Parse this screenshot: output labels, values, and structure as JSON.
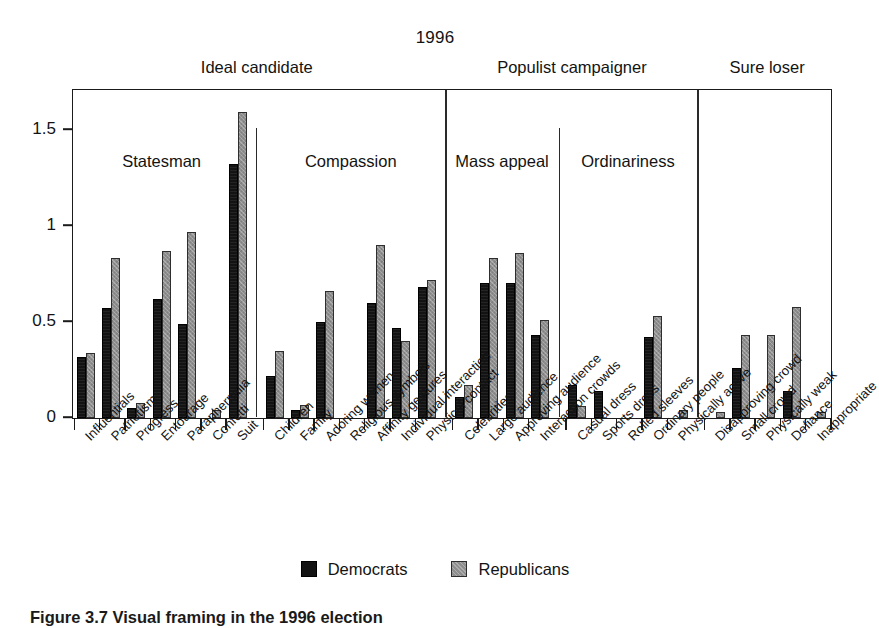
{
  "figure": {
    "year_title": "1996",
    "caption": "Figure 3.7 Visual framing in the 1996 election"
  },
  "legend": {
    "items": [
      {
        "label": "Democrats",
        "color": "#131313"
      },
      {
        "label": "Republicans",
        "color": "#8e8e8e"
      }
    ]
  },
  "supergroups": [
    {
      "label": "Ideal candidate"
    },
    {
      "label": "Populist campaigner"
    },
    {
      "label": "Sure loser"
    }
  ],
  "groups": [
    {
      "label": "Statesman"
    },
    {
      "label": "Compassion"
    },
    {
      "label": "Mass appeal"
    },
    {
      "label": "Ordinariness"
    },
    {
      "label": ""
    }
  ],
  "chart_data": {
    "type": "bar",
    "title": "1996",
    "xlabel": "",
    "ylabel": "",
    "ylim": [
      0,
      1.7
    ],
    "yticks": [
      0,
      0.5,
      1,
      1.5
    ],
    "ytick_labels": [
      "0",
      "0.5",
      "1",
      "1.5"
    ],
    "grid": false,
    "legend_position": "bottom-center",
    "series": [
      {
        "name": "Democrats",
        "color": "#131313",
        "values": [
          0.32,
          0.57,
          0.05,
          0.62,
          0.49,
          0.0,
          1.32,
          0.22,
          0.04,
          0.5,
          0.0,
          0.6,
          0.47,
          0.68,
          0.11,
          0.7,
          0.7,
          0.43,
          0.17,
          0.14,
          0.0,
          0.42,
          0.0,
          0.0,
          0.26,
          0.0,
          0.14,
          0.0
        ]
      },
      {
        "name": "Republicans",
        "color": "#8e8e8e",
        "values": [
          0.34,
          0.83,
          0.08,
          0.87,
          0.97,
          0.04,
          1.59,
          0.35,
          0.07,
          0.66,
          0.0,
          0.9,
          0.4,
          0.72,
          0.17,
          0.83,
          0.86,
          0.51,
          0.06,
          0.0,
          0.0,
          0.53,
          0.04,
          0.03,
          0.43,
          0.43,
          0.58,
          0.03
        ]
      }
    ],
    "categories": [
      "Influentials",
      "Patriotism",
      "Progress",
      "Entourage",
      "Paraphernalia",
      "Confetti",
      "Suit",
      "Children",
      "Family",
      "Adoring women",
      "Religious symbols",
      "Affinity gestures",
      "Individual interaction",
      "Physical contact",
      "Celebrities",
      "Large audience",
      "Approving audience",
      "Interaction crowds",
      "Casual dress",
      "Sports dress",
      "Rolled sleeves",
      "Ordinary people",
      "Physically active",
      "Disapproving crowd",
      "Small crowd",
      "Physically weak",
      "Defiance",
      "Inappropriate"
    ],
    "group_spans": [
      {
        "name": "Statesman",
        "start": 0,
        "end": 6,
        "supergroup": "Ideal candidate"
      },
      {
        "name": "Compassion",
        "start": 7,
        "end": 13,
        "supergroup": "Ideal candidate"
      },
      {
        "name": "Mass appeal",
        "start": 14,
        "end": 17,
        "supergroup": "Populist campaigner"
      },
      {
        "name": "Ordinariness",
        "start": 18,
        "end": 22,
        "supergroup": "Populist campaigner"
      },
      {
        "name": "",
        "start": 23,
        "end": 27,
        "supergroup": "Sure loser"
      }
    ]
  }
}
